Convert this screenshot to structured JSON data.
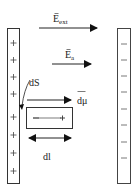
{
  "diagram": {
    "type": "parallel-plate-capacitor-dielectric",
    "left_plate": {
      "charge_sign": "+",
      "signs": [
        "+",
        "+",
        "+",
        "+",
        "+",
        "+",
        "+",
        "+",
        "+",
        "+"
      ]
    },
    "right_plate": {
      "charge_sign": "−",
      "signs": [
        "−",
        "−",
        "−",
        "−",
        "−",
        "−",
        "−",
        "−"
      ]
    },
    "labels": {
      "e_ext": {
        "main": "E",
        "sub": "ext",
        "vector": true
      },
      "e_a": {
        "main": "E",
        "sub": "a",
        "vector": true
      },
      "ds": "dS",
      "dmu": "dμ",
      "dl": "dl",
      "dipole_minus": "−",
      "dipole_plus": "+"
    },
    "colors": {
      "stroke": "#333333",
      "plate_fill": "#ffffff",
      "background": "#ffffff"
    }
  }
}
